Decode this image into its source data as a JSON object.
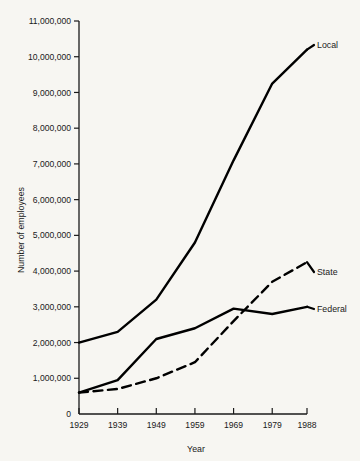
{
  "chart_data": {
    "type": "line",
    "title": "",
    "xlabel": "Year",
    "ylabel": "Number of employees",
    "x": [
      1929,
      1939,
      1949,
      1959,
      1969,
      1979,
      1988
    ],
    "xtick_labels": [
      "1929",
      "1939",
      "1949",
      "1959",
      "1969",
      "1979",
      "1988"
    ],
    "xlim": [
      1929,
      1988
    ],
    "ylim": [
      0,
      11000000
    ],
    "ytick_values": [
      0,
      1000000,
      2000000,
      3000000,
      4000000,
      5000000,
      6000000,
      7000000,
      8000000,
      9000000,
      10000000,
      11000000
    ],
    "ytick_labels": [
      "0",
      "1,000,000",
      "2,000,000",
      "3,000,000",
      "4,000,000",
      "5,000,000",
      "6,000,000",
      "7,000,000",
      "8,000,000",
      "9,000,000",
      "10,000,000",
      "11,000,000"
    ],
    "grid": false,
    "legend_position": "inline-right-of-line-ends",
    "series": [
      {
        "name": "Local",
        "label": "Local",
        "style": "solid",
        "color": "#000000",
        "values": [
          2000000,
          2300000,
          3200000,
          4800000,
          7100000,
          9250000,
          10200000
        ]
      },
      {
        "name": "State",
        "label": "State",
        "style": "dashed",
        "color": "#000000",
        "values": [
          600000,
          700000,
          1000000,
          1450000,
          2600000,
          3700000,
          4250000
        ]
      },
      {
        "name": "Federal",
        "label": "Federal",
        "style": "solid",
        "color": "#000000",
        "values": [
          600000,
          950000,
          2100000,
          2400000,
          2950000,
          2800000,
          3000000
        ]
      }
    ]
  },
  "colors": {
    "background": "#f7f6f2",
    "ink": "#1a1a1a",
    "line": "#000000"
  }
}
